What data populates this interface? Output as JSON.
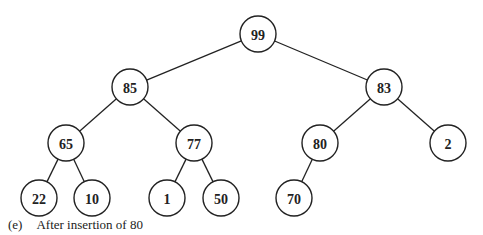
{
  "diagram": {
    "type": "binary-heap",
    "caption": {
      "label": "(e)",
      "text": "After insertion of 80"
    },
    "nodes": [
      {
        "id": "n0",
        "value": "99",
        "x": 258,
        "y": 34
      },
      {
        "id": "n1",
        "value": "85",
        "x": 130,
        "y": 87
      },
      {
        "id": "n2",
        "value": "83",
        "x": 384,
        "y": 87
      },
      {
        "id": "n3",
        "value": "65",
        "x": 66,
        "y": 143
      },
      {
        "id": "n4",
        "value": "77",
        "x": 194,
        "y": 143
      },
      {
        "id": "n5",
        "value": "80",
        "x": 320,
        "y": 143
      },
      {
        "id": "n6",
        "value": "2",
        "x": 448,
        "y": 143
      },
      {
        "id": "n7",
        "value": "22",
        "x": 39,
        "y": 198
      },
      {
        "id": "n8",
        "value": "10",
        "x": 92,
        "y": 198
      },
      {
        "id": "n9",
        "value": "1",
        "x": 167,
        "y": 198
      },
      {
        "id": "n10",
        "value": "50",
        "x": 221,
        "y": 198
      },
      {
        "id": "n11",
        "value": "70",
        "x": 294,
        "y": 198
      }
    ],
    "edges": [
      [
        "n0",
        "n1"
      ],
      [
        "n0",
        "n2"
      ],
      [
        "n1",
        "n3"
      ],
      [
        "n1",
        "n4"
      ],
      [
        "n2",
        "n5"
      ],
      [
        "n2",
        "n6"
      ],
      [
        "n3",
        "n7"
      ],
      [
        "n3",
        "n8"
      ],
      [
        "n4",
        "n9"
      ],
      [
        "n4",
        "n10"
      ],
      [
        "n5",
        "n11"
      ]
    ],
    "node_radius": 18
  }
}
